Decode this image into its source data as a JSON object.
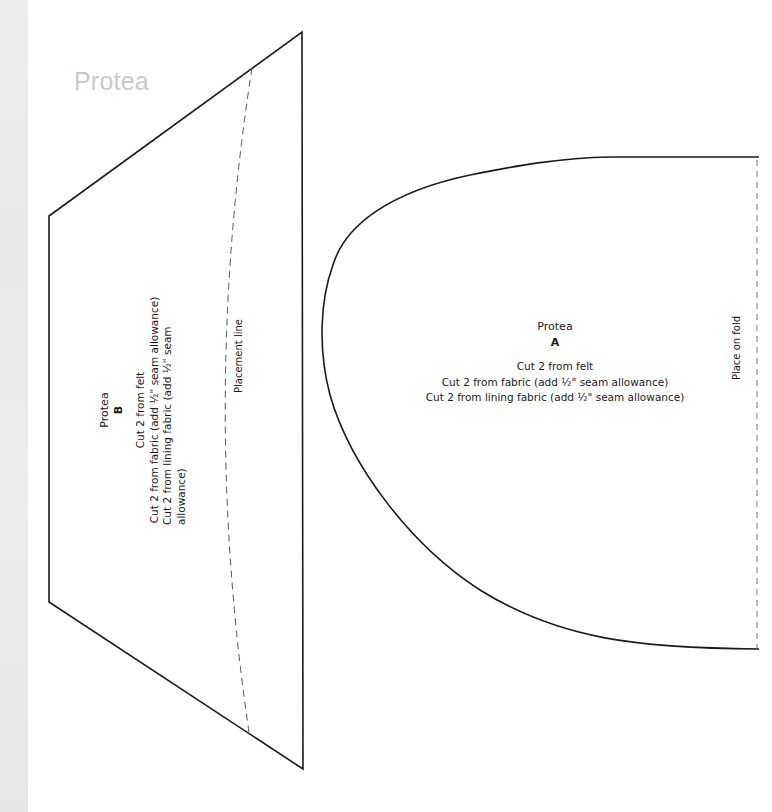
{
  "page": {
    "title": "Protea",
    "accent_color": "#c9c9c9",
    "line_color": "#1a1a1a",
    "strip_color": "#ebebeb"
  },
  "piece_b": {
    "name": "Protea",
    "letter": "B",
    "instructions": [
      "Cut 2 from felt",
      "Cut 2 from fabric (add ½\" seam allowance)",
      "Cut 2 from lining fabric (add ½\" seam allowance)"
    ],
    "placement_label": "Placement line"
  },
  "piece_a": {
    "name": "Protea",
    "letter": "A",
    "instructions": [
      "Cut 2 from felt",
      "Cut 2 from fabric (add ½\" seam allowance)",
      "Cut 2 from lining fabric (add ½\" seam allowance)"
    ],
    "fold_label": "Place on fold"
  }
}
